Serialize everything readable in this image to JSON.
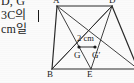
{
  "document": {
    "type": "korean-math-textbook-figure",
    "language": "ko"
  },
  "text_column": {
    "lines": [
      {
        "id": "line1",
        "text": "D, G",
        "note": "top line clipped by crop"
      },
      {
        "id": "line2",
        "text": "3C의"
      },
      {
        "id": "line3",
        "text": "cm일"
      }
    ]
  },
  "figure": {
    "vertex_labels": [
      {
        "name": "A",
        "text": "A",
        "x": 7,
        "y": -4
      },
      {
        "name": "D",
        "text": "D",
        "x": 63,
        "y": -4
      },
      {
        "name": "B",
        "text": "B",
        "x": 2,
        "y": 70
      },
      {
        "name": "E",
        "text": "E",
        "x": 41,
        "y": 70
      },
      {
        "name": "G",
        "text": "G",
        "x": 28,
        "y": 51
      },
      {
        "name": "G-prime",
        "text": "G′",
        "x": 46,
        "y": 51
      }
    ],
    "measurements": [
      {
        "name": "gg-prime-length",
        "text": "2 cm",
        "x": 31,
        "y": 34
      }
    ],
    "points": [
      {
        "name": "A",
        "x": 11,
        "y": 6
      },
      {
        "name": "D",
        "x": 66,
        "y": 6
      },
      {
        "name": "B",
        "x": 6,
        "y": 69
      },
      {
        "name": "E",
        "x": 45,
        "y": 69
      },
      {
        "name": "C",
        "x": 92,
        "y": 69
      },
      {
        "name": "G",
        "x": 33,
        "y": 47
      },
      {
        "name": "G-prime",
        "x": 49,
        "y": 47
      }
    ],
    "edges": [
      {
        "name": "edge-A-D",
        "from": "A",
        "to": "D"
      },
      {
        "name": "edge-A-B",
        "from": "A",
        "to": "B"
      },
      {
        "name": "edge-B-C",
        "from": "B",
        "to": "C"
      },
      {
        "name": "edge-D-C",
        "from": "D",
        "to": "C"
      },
      {
        "name": "edge-A-E",
        "from": "A",
        "to": "E"
      },
      {
        "name": "edge-D-E",
        "from": "D",
        "to": "E"
      },
      {
        "name": "edge-A-C",
        "from": "A",
        "to": "C"
      },
      {
        "name": "edge-D-B",
        "from": "D",
        "to": "B"
      },
      {
        "name": "edge-B-G-prime",
        "from": "B",
        "to": "G-prime"
      },
      {
        "name": "edge-G-G-prime",
        "from": "G",
        "to": "G-prime"
      }
    ],
    "colors": {
      "stroke": "#2b2b2b",
      "dot": "#1a1a1a",
      "background": "#fbfbfb"
    }
  }
}
